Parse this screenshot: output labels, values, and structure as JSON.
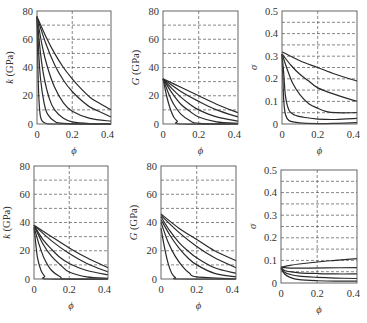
{
  "chart_data": [
    {
      "id": "top-left",
      "type": "line",
      "ylabel": "k (GPa)",
      "xlabel": "ϕ",
      "xlim": [
        0,
        0.42
      ],
      "ylim": [
        0,
        80
      ],
      "xticks": [
        0,
        0.2,
        0.4
      ],
      "xtick_labels": [
        "0",
        "0.2",
        "0.4"
      ],
      "yticks": [
        0,
        20,
        40,
        60,
        80
      ],
      "ytick_labels": [
        "0",
        "20",
        "40",
        "60",
        "80"
      ],
      "grid_y": [
        10,
        20,
        30,
        40,
        50,
        60,
        70
      ],
      "grid_x": [
        0.2
      ],
      "series": [
        {
          "name": "curve-1",
          "x": [
            0,
            0.005,
            0.01,
            0.015,
            0.02,
            0.03,
            0.05,
            0.1,
            0.42
          ],
          "y": [
            76,
            40,
            20,
            10,
            5,
            2,
            0.5,
            0,
            0
          ]
        },
        {
          "name": "curve-2",
          "x": [
            0,
            0.01,
            0.02,
            0.04,
            0.06,
            0.1,
            0.15,
            0.42
          ],
          "y": [
            76,
            50,
            32,
            15,
            7,
            2,
            0.5,
            0
          ]
        },
        {
          "name": "curve-3",
          "x": [
            0,
            0.02,
            0.04,
            0.07,
            0.1,
            0.15,
            0.2,
            0.3,
            0.42
          ],
          "y": [
            76,
            50,
            33,
            18,
            10,
            4,
            1.5,
            0.3,
            0
          ]
        },
        {
          "name": "curve-4",
          "x": [
            0,
            0.03,
            0.06,
            0.1,
            0.15,
            0.2,
            0.3,
            0.42
          ],
          "y": [
            76,
            55,
            40,
            26,
            15,
            9,
            4,
            2
          ]
        },
        {
          "name": "curve-5",
          "x": [
            0,
            0.05,
            0.1,
            0.15,
            0.2,
            0.25,
            0.3,
            0.35,
            0.42
          ],
          "y": [
            76,
            57,
            42,
            31,
            23,
            17,
            12,
            9,
            5
          ]
        },
        {
          "name": "curve-6",
          "x": [
            0,
            0.05,
            0.1,
            0.15,
            0.2,
            0.25,
            0.3,
            0.35,
            0.42
          ],
          "y": [
            76,
            62,
            50,
            40,
            32,
            25,
            19,
            15,
            10
          ]
        }
      ]
    },
    {
      "id": "top-middle",
      "type": "line",
      "ylabel": "G (GPa)",
      "xlabel": "ϕ",
      "xlim": [
        0,
        0.42
      ],
      "ylim": [
        0,
        80
      ],
      "xticks": [
        0,
        0.2,
        0.4
      ],
      "xtick_labels": [
        "0",
        "0.2",
        "0.4"
      ],
      "yticks": [
        0,
        20,
        40,
        60,
        80
      ],
      "ytick_labels": [
        "0",
        "20",
        "40",
        "60",
        "80"
      ],
      "grid_y": [
        10,
        20,
        30,
        40,
        50,
        60,
        70
      ],
      "grid_x": [
        0.2
      ],
      "series": [
        {
          "name": "curve-1",
          "x": [
            0,
            0.02,
            0.04,
            0.06,
            0.08,
            0.1,
            0.42
          ],
          "y": [
            32,
            20,
            11,
            5,
            2,
            0,
            0
          ]
        },
        {
          "name": "curve-2",
          "x": [
            0,
            0.03,
            0.06,
            0.1,
            0.15,
            0.2,
            0.42
          ],
          "y": [
            32,
            22,
            14,
            7,
            2.5,
            0.5,
            0
          ]
        },
        {
          "name": "curve-3",
          "x": [
            0,
            0.05,
            0.1,
            0.15,
            0.2,
            0.3,
            0.42
          ],
          "y": [
            32,
            22,
            14,
            9,
            5,
            1.5,
            0.5
          ]
        },
        {
          "name": "curve-4",
          "x": [
            0,
            0.05,
            0.1,
            0.15,
            0.2,
            0.3,
            0.42
          ],
          "y": [
            32,
            25,
            19,
            14,
            10,
            5,
            2
          ]
        },
        {
          "name": "curve-5",
          "x": [
            0,
            0.1,
            0.2,
            0.3,
            0.42
          ],
          "y": [
            32,
            23,
            16,
            10,
            5
          ]
        },
        {
          "name": "curve-6",
          "x": [
            0,
            0.1,
            0.2,
            0.3,
            0.42
          ],
          "y": [
            32,
            26,
            20,
            14,
            8
          ]
        }
      ]
    },
    {
      "id": "top-right",
      "type": "line",
      "ylabel": "σ",
      "xlabel": "ϕ",
      "xlim": [
        0,
        0.42
      ],
      "ylim": [
        0,
        0.5
      ],
      "xticks": [
        0,
        0.2,
        0.4
      ],
      "xtick_labels": [
        "0",
        "0.2",
        "0.4"
      ],
      "yticks": [
        0,
        0.1,
        0.2,
        0.3,
        0.4,
        0.5
      ],
      "ytick_labels": [
        "0",
        "0.1",
        "0.2",
        "0.3",
        "0.4",
        "0.5"
      ],
      "grid_y": [
        0.05,
        0.1,
        0.15,
        0.2,
        0.25,
        0.3,
        0.35,
        0.4,
        0.45
      ],
      "grid_x": [
        0.2
      ],
      "series": [
        {
          "name": "curve-1",
          "x": [
            0,
            0.005,
            0.01,
            0.02,
            0.04,
            0.1,
            0.2,
            0.3,
            0.42
          ],
          "y": [
            0.31,
            0.2,
            0.1,
            0.04,
            0.015,
            0.005,
            0.002,
            0.003,
            0.006
          ]
        },
        {
          "name": "curve-2",
          "x": [
            0,
            0.01,
            0.02,
            0.04,
            0.07,
            0.12,
            0.2,
            0.3,
            0.42
          ],
          "y": [
            0.31,
            0.22,
            0.12,
            0.06,
            0.04,
            0.03,
            0.022,
            0.02,
            0.025
          ]
        },
        {
          "name": "curve-3",
          "x": [
            0,
            0.03,
            0.06,
            0.1,
            0.15,
            0.2,
            0.25,
            0.3,
            0.42
          ],
          "y": [
            0.31,
            0.24,
            0.18,
            0.13,
            0.09,
            0.07,
            0.055,
            0.05,
            0.05
          ]
        },
        {
          "name": "curve-4",
          "x": [
            0,
            0.05,
            0.1,
            0.15,
            0.2,
            0.3,
            0.42
          ],
          "y": [
            0.31,
            0.26,
            0.22,
            0.19,
            0.16,
            0.13,
            0.1
          ]
        },
        {
          "name": "curve-5",
          "x": [
            0,
            0.1,
            0.2,
            0.3,
            0.42
          ],
          "y": [
            0.32,
            0.28,
            0.25,
            0.22,
            0.19
          ]
        }
      ]
    },
    {
      "id": "bottom-left",
      "type": "line",
      "ylabel": "k (GPa)",
      "xlabel": "ϕ",
      "xlim": [
        0,
        0.42
      ],
      "ylim": [
        0,
        80
      ],
      "xticks": [
        0,
        0.2,
        0.4
      ],
      "xtick_labels": [
        "0",
        "0.2",
        "0.4"
      ],
      "yticks": [
        0,
        20,
        40,
        60,
        80
      ],
      "ytick_labels": [
        "0",
        "20",
        "40",
        "60",
        "80"
      ],
      "grid_y": [
        10,
        20,
        30,
        40,
        50,
        60,
        70
      ],
      "grid_x": [
        0.2
      ],
      "series": [
        {
          "name": "curve-1",
          "x": [
            0,
            0.01,
            0.02,
            0.04,
            0.06,
            0.08,
            0.42
          ],
          "y": [
            36,
            25,
            15,
            6,
            2,
            0,
            0
          ]
        },
        {
          "name": "curve-2",
          "x": [
            0,
            0.03,
            0.06,
            0.1,
            0.15,
            0.18,
            0.42
          ],
          "y": [
            37,
            24,
            14,
            6,
            1.5,
            0,
            0
          ]
        },
        {
          "name": "curve-3",
          "x": [
            0,
            0.05,
            0.1,
            0.15,
            0.2,
            0.3,
            0.42
          ],
          "y": [
            38,
            25,
            16,
            10,
            5,
            1.5,
            0.5
          ]
        },
        {
          "name": "curve-4",
          "x": [
            0,
            0.05,
            0.1,
            0.15,
            0.2,
            0.3,
            0.42
          ],
          "y": [
            38,
            28,
            21,
            15,
            11,
            6,
            3
          ]
        },
        {
          "name": "curve-5",
          "x": [
            0,
            0.1,
            0.2,
            0.3,
            0.42
          ],
          "y": [
            38,
            27,
            18,
            11,
            5
          ]
        },
        {
          "name": "curve-6",
          "x": [
            0,
            0.1,
            0.2,
            0.3,
            0.42
          ],
          "y": [
            38,
            30,
            22,
            15,
            8
          ]
        }
      ]
    },
    {
      "id": "bottom-middle",
      "type": "line",
      "ylabel": "G (GPa)",
      "xlabel": "ϕ",
      "xlim": [
        0,
        0.42
      ],
      "ylim": [
        0,
        80
      ],
      "xticks": [
        0,
        0.2,
        0.4
      ],
      "xtick_labels": [
        "0",
        "0.2",
        "0.4"
      ],
      "yticks": [
        0,
        20,
        40,
        60,
        80
      ],
      "ytick_labels": [
        "0",
        "20",
        "40",
        "60",
        "80"
      ],
      "grid_y": [
        10,
        20,
        30,
        40,
        50,
        60,
        70
      ],
      "grid_x": [
        0.2
      ],
      "series": [
        {
          "name": "curve-1",
          "x": [
            0,
            0.02,
            0.04,
            0.06,
            0.08,
            0.1,
            0.42
          ],
          "y": [
            36,
            22,
            11,
            4,
            1,
            0,
            0
          ]
        },
        {
          "name": "curve-2",
          "x": [
            0,
            0.04,
            0.08,
            0.12,
            0.16,
            0.2,
            0.42
          ],
          "y": [
            40,
            26,
            16,
            9,
            4,
            1.5,
            0
          ]
        },
        {
          "name": "curve-3",
          "x": [
            0,
            0.05,
            0.1,
            0.15,
            0.2,
            0.3,
            0.42
          ],
          "y": [
            42,
            31,
            22,
            15,
            10,
            4,
            1.5
          ]
        },
        {
          "name": "curve-4",
          "x": [
            0,
            0.05,
            0.1,
            0.15,
            0.2,
            0.3,
            0.42
          ],
          "y": [
            44,
            34,
            26,
            20,
            15,
            8,
            4
          ]
        },
        {
          "name": "curve-5",
          "x": [
            0,
            0.1,
            0.2,
            0.3,
            0.42
          ],
          "y": [
            45,
            33,
            23,
            15,
            8
          ]
        },
        {
          "name": "curve-6",
          "x": [
            0,
            0.1,
            0.2,
            0.3,
            0.42
          ],
          "y": [
            46,
            36,
            28,
            20,
            13
          ]
        }
      ]
    },
    {
      "id": "bottom-right",
      "type": "line",
      "ylabel": "σ",
      "xlabel": "ϕ",
      "xlim": [
        0,
        0.42
      ],
      "ylim": [
        0,
        0.5
      ],
      "xticks": [
        0,
        0.2,
        0.4
      ],
      "xtick_labels": [
        "0",
        "0.2",
        "0.4"
      ],
      "yticks": [
        0,
        0.1,
        0.2,
        0.3,
        0.4,
        0.5
      ],
      "ytick_labels": [
        "0",
        "0.1",
        "0.2",
        "0.3",
        "0.4",
        "0.5"
      ],
      "grid_y": [
        0.05,
        0.1,
        0.15,
        0.2,
        0.25,
        0.3,
        0.35,
        0.4,
        0.45
      ],
      "grid_x": [
        0.2
      ],
      "series": [
        {
          "name": "curve-1",
          "x": [
            0,
            0.02,
            0.05,
            0.1,
            0.2,
            0.3,
            0.42
          ],
          "y": [
            0.065,
            0.04,
            0.025,
            0.015,
            0.01,
            0.008,
            0.008
          ]
        },
        {
          "name": "curve-2",
          "x": [
            0,
            0.02,
            0.05,
            0.1,
            0.2,
            0.3,
            0.42
          ],
          "y": [
            0.065,
            0.048,
            0.038,
            0.03,
            0.025,
            0.022,
            0.02
          ]
        },
        {
          "name": "curve-3",
          "x": [
            0,
            0.02,
            0.05,
            0.1,
            0.2,
            0.3,
            0.42
          ],
          "y": [
            0.068,
            0.055,
            0.05,
            0.045,
            0.042,
            0.04,
            0.04
          ]
        },
        {
          "name": "curve-4",
          "x": [
            0,
            0.03,
            0.08,
            0.15,
            0.25,
            0.42
          ],
          "y": [
            0.07,
            0.067,
            0.066,
            0.066,
            0.067,
            0.068
          ]
        },
        {
          "name": "curve-5",
          "x": [
            0,
            0.05,
            0.1,
            0.2,
            0.3,
            0.42
          ],
          "y": [
            0.07,
            0.078,
            0.084,
            0.093,
            0.1,
            0.108
          ]
        }
      ]
    }
  ],
  "layout": {
    "panels": [
      {
        "id": "top-left",
        "x0": 37,
        "x1": 111,
        "y0": 11,
        "y1": 124
      },
      {
        "id": "top-middle",
        "x0": 163,
        "x1": 238,
        "y0": 11,
        "y1": 124
      },
      {
        "id": "top-right",
        "x0": 282,
        "x1": 357,
        "y0": 11,
        "y1": 124
      },
      {
        "id": "bottom-left",
        "x0": 34,
        "x1": 108,
        "y0": 166,
        "y1": 279
      },
      {
        "id": "bottom-middle",
        "x0": 161,
        "x1": 236,
        "y0": 166,
        "y1": 279
      },
      {
        "id": "bottom-right",
        "x0": 281,
        "x1": 357,
        "y0": 170,
        "y1": 283
      }
    ]
  }
}
